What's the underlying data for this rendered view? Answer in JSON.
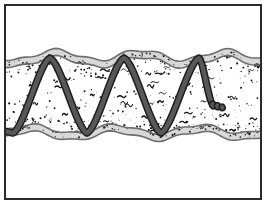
{
  "figure": {
    "style": "black-and-white line art illustration",
    "caption": "A horizontal band of speckled, granular material bounded by wavy gray-outlined edges, with a heavy dark sinusoidal wire woven through it and a small coiled hook at the right-hand end."
  },
  "frame": {
    "name": "outer-border",
    "stroke_color": "#2b2b2b",
    "stroke_width": 2,
    "fill_color": "#ffffff",
    "x": 5,
    "y": 5,
    "width": 256,
    "height": 194
  },
  "band": {
    "name": "material-layer",
    "fill_color": "#ffffff",
    "edge_fill_color": "#d8d8d8",
    "outline_color": "#6e6e6e",
    "outline_width": 1.6,
    "top_baseline_y": 55,
    "bottom_baseline_y": 136,
    "left_x": 6,
    "right_x": 260,
    "edge_thickness": 7,
    "wave_amplitude": 5,
    "wave_count": 3
  },
  "texture": {
    "name": "stipple-texture",
    "dot_color": "#1a1a1a",
    "squiggle_color": "#111111",
    "dot_count": 430,
    "squiggle_count": 58,
    "description": "dense random speckles and short hooked squiggles filling the band interior"
  },
  "wire": {
    "name": "sinusoidal-wire",
    "outline_color": "#1e1e1e",
    "core_color": "#585858",
    "outer_width": 7.5,
    "inner_width": 4.5,
    "peak_y": 58,
    "valley_y": 133,
    "peaks_x": [
      50,
      124,
      199
    ],
    "valleys_x": [
      13,
      87,
      161
    ],
    "start_x": 6,
    "end_x": 213,
    "coil_end": {
      "name": "coiled-wire-tip",
      "center_x": 213,
      "center_y": 105,
      "ring_count": 3,
      "color": "#585858",
      "outline_color": "#1e1e1e"
    }
  },
  "palette": {
    "background": "#ffffff",
    "border": "#2b2b2b",
    "band_edge": "#d8d8d8",
    "band_outline": "#6e6e6e",
    "wire_dark": "#1e1e1e",
    "wire_mid": "#585858",
    "texture_ink": "#111111"
  }
}
